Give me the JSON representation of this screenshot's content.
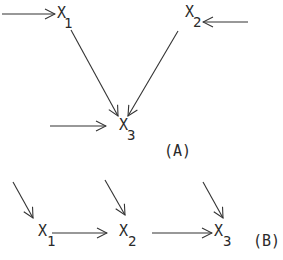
{
  "diagrams": [
    {
      "id": "A",
      "label": "(A)",
      "nodes": [
        {
          "id": "x1",
          "symbol": "X",
          "subscript": "1"
        },
        {
          "id": "x2",
          "symbol": "X",
          "subscript": "2"
        },
        {
          "id": "x3",
          "symbol": "X",
          "subscript": "3"
        }
      ],
      "edges": [
        {
          "from": "external",
          "to": "x1"
        },
        {
          "from": "external",
          "to": "x2"
        },
        {
          "from": "x1",
          "to": "x3"
        },
        {
          "from": "x2",
          "to": "x3"
        },
        {
          "from": "external",
          "to": "x3"
        }
      ]
    },
    {
      "id": "B",
      "label": "(B)",
      "nodes": [
        {
          "id": "x1",
          "symbol": "X",
          "subscript": "1"
        },
        {
          "id": "x2",
          "symbol": "X",
          "subscript": "2"
        },
        {
          "id": "x3",
          "symbol": "X",
          "subscript": "3"
        }
      ],
      "edges": [
        {
          "from": "external",
          "to": "x1"
        },
        {
          "from": "external",
          "to": "x2"
        },
        {
          "from": "external",
          "to": "x3"
        },
        {
          "from": "x1",
          "to": "x2"
        },
        {
          "from": "x2",
          "to": "x3"
        }
      ]
    }
  ]
}
